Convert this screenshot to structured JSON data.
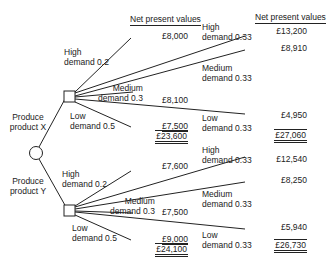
{
  "diagram": {
    "type": "decision-tree",
    "headers": {
      "npv_stage1": "Net present values",
      "npv_stage2": "Net present values"
    },
    "decisions": {
      "x": {
        "line1": "Produce",
        "line2": "product X"
      },
      "y": {
        "line1": "Produce",
        "line2": "product Y"
      }
    },
    "branches_stage1": {
      "high": {
        "line1": "High",
        "line2": "demand 0.2"
      },
      "medium": {
        "line1": "Medium",
        "line2": "demand 0.3"
      },
      "low": {
        "line1": "Low",
        "line2": "demand 0.5"
      }
    },
    "branches_stage2": {
      "high": {
        "line1": "High",
        "line2": "demand 0.33"
      },
      "medium": {
        "line1": "Medium",
        "line2": "demand 0.33"
      },
      "low": {
        "line1": "Low",
        "line2": "demand 0.33"
      }
    },
    "product_x": {
      "stage1": {
        "high": "£8,000",
        "medium": "£8,100",
        "low": "£7,500",
        "total": "£23,600"
      },
      "stage2": {
        "high": "£13,200",
        "medium": "£8,910",
        "low": "£4,950",
        "total": "£27,060"
      }
    },
    "product_y": {
      "stage1": {
        "high": "£7,600",
        "medium": "£7,500",
        "low": "£9,000",
        "total": "£24,100"
      },
      "stage2": {
        "high": "£12,540",
        "medium": "£8,250",
        "low": "£5,940",
        "total": "£26,730"
      }
    }
  }
}
